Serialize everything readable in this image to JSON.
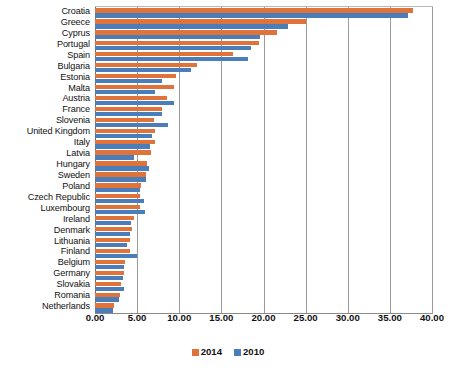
{
  "chart_data": {
    "type": "bar",
    "orientation": "horizontal",
    "title": "",
    "subtitle": "",
    "xlabel": "",
    "ylabel": "",
    "xlim": [
      0,
      40
    ],
    "xticks": [
      "0.00",
      "5.00",
      "10.00",
      "15.00",
      "20.00",
      "25.00",
      "30.00",
      "35.00",
      "40.00"
    ],
    "xtick_values": [
      0,
      5,
      10,
      15,
      20,
      25,
      30,
      35,
      40
    ],
    "grid": true,
    "legend_position": "bottom",
    "categories": [
      "Croatia",
      "Greece",
      "Cyprus",
      "Portugal",
      "Spain",
      "Bulgaria",
      "Estonia",
      "Malta",
      "Austria",
      "France",
      "Slovenia",
      "United Kingdom",
      "Italy",
      "Latvia",
      "Hungary",
      "Sweden",
      "Poland",
      "Czech Republic",
      "Luxembourg",
      "Ireland",
      "Denmark",
      "Lithuania",
      "Finland",
      "Belgium",
      "Germany",
      "Slovakia",
      "Romania",
      "Netherlands"
    ],
    "series": [
      {
        "name": "2014",
        "color": "#E0733A",
        "values": [
          37.7,
          25.1,
          21.6,
          19.5,
          16.4,
          12.1,
          9.6,
          9.4,
          8.6,
          8.0,
          7.0,
          7.1,
          7.1,
          6.6,
          6.2,
          6.1,
          5.5,
          5.3,
          5.3,
          4.6,
          4.4,
          4.2,
          4.1,
          3.6,
          3.4,
          3.1,
          3.0,
          2.3
        ]
      },
      {
        "name": "2010",
        "color": "#4A7EBB",
        "values": [
          37.2,
          22.9,
          19.6,
          18.5,
          18.2,
          11.4,
          8.0,
          7.1,
          9.4,
          8.0,
          8.7,
          6.8,
          6.5,
          4.6,
          6.4,
          6.0,
          5.4,
          5.8,
          5.9,
          4.3,
          4.2,
          3.8,
          5.0,
          3.5,
          3.3,
          3.4,
          2.8,
          2.1
        ]
      }
    ]
  },
  "legend": {
    "items": [
      {
        "label": "2014",
        "color": "#E0733A"
      },
      {
        "label": "2010",
        "color": "#4A7EBB"
      }
    ]
  }
}
